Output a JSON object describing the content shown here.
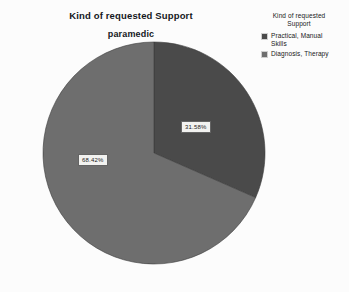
{
  "chart_data": {
    "type": "pie",
    "title": "Kind of requested Support",
    "subtitle": "paramedic",
    "xlabel": "",
    "ylabel": "",
    "legend_position": "top-right",
    "grid": false,
    "categories": [
      "Practical, Manual Skills",
      "Diagnosis, Therapy"
    ],
    "values": [
      31.58,
      68.42
    ],
    "value_unit": "%",
    "slices": [
      {
        "label": "Practical, Manual Skills",
        "value": 31.58,
        "data_label": "31.58%",
        "color": "#4a4a4a",
        "start_angle_deg": 0,
        "sweep_angle_deg": 113.69
      },
      {
        "label": "Diagnosis, Therapy",
        "value": 68.42,
        "data_label": "68.42%",
        "color": "#6e6e6e",
        "start_angle_deg": 113.69,
        "sweep_angle_deg": 246.31
      }
    ]
  },
  "legend": {
    "title": "Kind of requested Support",
    "items": [
      {
        "label": "Practical, Manual Skills",
        "color": "#4a4a4a"
      },
      {
        "label": "Diagnosis, Therapy",
        "color": "#6e6e6e"
      }
    ]
  },
  "colors": {
    "background": "#fcfcfc",
    "slice_practical": "#4a4a4a",
    "slice_diagnosis": "#6e6e6e",
    "label_box_fill": "#f2f2f0",
    "label_box_border": "#646464",
    "text": "#15181c"
  }
}
